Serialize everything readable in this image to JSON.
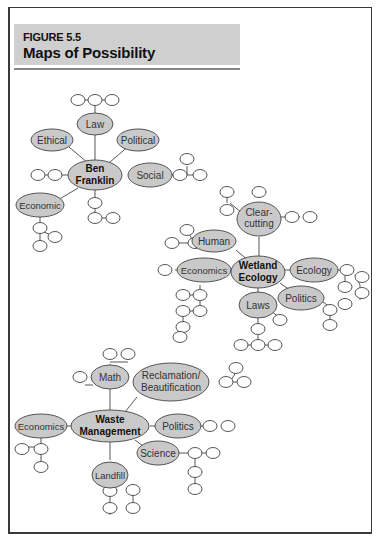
{
  "figure": {
    "label": "FIGURE 5.5",
    "title": "Maps of Possibility"
  },
  "colors": {
    "node_fill": "#c9c9c9",
    "node_stroke": "#444444",
    "header_fill": "#cfcfcf",
    "line": "#444444"
  },
  "maps": [
    {
      "center": "Ben Franklin",
      "center_lines": [
        "Ben",
        "Franklin"
      ],
      "branches": [
        "Law",
        "Ethical",
        "Political",
        "Social",
        "Economic"
      ]
    },
    {
      "center": "Wetland Ecology",
      "center_lines": [
        "Wetland",
        "Ecology"
      ],
      "branches": [
        "Clear-cutting",
        "Human",
        "Economics",
        "Ecology",
        "Politics",
        "Laws"
      ],
      "branch_lines": {
        "Clear-cutting": [
          "Clear-",
          "cutting"
        ]
      }
    },
    {
      "center": "Waste Management",
      "center_lines": [
        "Waste",
        "Management"
      ],
      "branches": [
        "Math",
        "Reclamation/Beautification",
        "Economics",
        "Politics",
        "Science",
        "Landfill"
      ],
      "branch_lines": {
        "Reclamation/Beautification": [
          "Reclamation/",
          "Beautification"
        ]
      }
    }
  ],
  "labels": {
    "bf_center_1": "Ben",
    "bf_center_2": "Franklin",
    "bf_law": "Law",
    "bf_ethical": "Ethical",
    "bf_political": "Political",
    "bf_social": "Social",
    "bf_economic": "Economic",
    "we_center_1": "Wetland",
    "we_center_2": "Ecology",
    "we_clear_1": "Clear-",
    "we_clear_2": "cutting",
    "we_human": "Human",
    "we_economics": "Economics",
    "we_ecology": "Ecology",
    "we_politics": "Politics",
    "we_laws": "Laws",
    "wm_center_1": "Waste",
    "wm_center_2": "Management",
    "wm_math": "Math",
    "wm_recl_1": "Reclamation/",
    "wm_recl_2": "Beautification",
    "wm_economics": "Economics",
    "wm_politics": "Politics",
    "wm_science": "Science",
    "wm_landfill": "Landfill"
  }
}
